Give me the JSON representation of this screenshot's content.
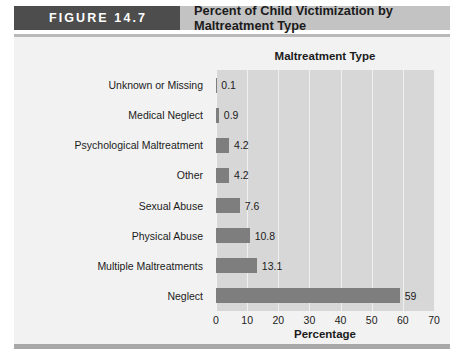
{
  "header": {
    "figure_tag": "FIGURE 14.7",
    "banner_title": "Percent of Child Victimization by Maltreatment Type",
    "tag_color": "#4d4d4d",
    "banner_color": "#c3c3c3"
  },
  "chart_data": {
    "type": "bar",
    "orientation": "horizontal",
    "title": "Maltreatment Type",
    "xlabel": "Percentage",
    "ylabel": "",
    "xlim": [
      0,
      70
    ],
    "xticks": [
      0,
      10,
      20,
      30,
      40,
      50,
      60,
      70
    ],
    "grid": true,
    "legend": "none",
    "bar_color": "#7e7e7e",
    "plot_background": "#d7d7d7",
    "categories": [
      "Unknown or Missing",
      "Medical Neglect",
      "Psychological Maltreatment",
      "Other",
      "Sexual Abuse",
      "Physical Abuse",
      "Multiple Maltreatments",
      "Neglect"
    ],
    "values": [
      0.1,
      0.9,
      4.2,
      4.2,
      7.6,
      10.8,
      13.1,
      59
    ],
    "value_labels": [
      "0.1",
      "0.9",
      "4.2",
      "4.2",
      "7.6",
      "10.8",
      "13.1",
      "59"
    ]
  }
}
